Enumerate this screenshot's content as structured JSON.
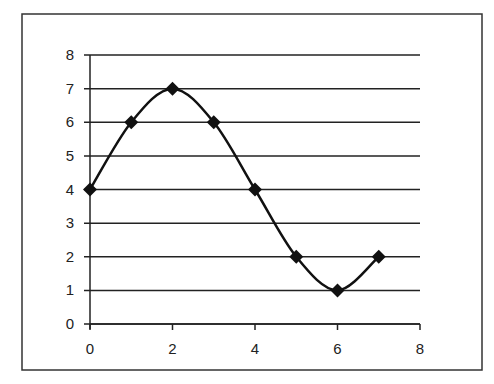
{
  "chart_data": {
    "type": "line",
    "title": "",
    "xlabel": "",
    "ylabel": "",
    "x": [
      0,
      1,
      2,
      3,
      4,
      5,
      6,
      7
    ],
    "series": [
      {
        "name": "Series 1",
        "values": [
          4,
          6,
          7,
          6,
          4,
          2,
          1,
          2
        ],
        "marker": "diamond",
        "smooth": true,
        "color": "#111111"
      }
    ],
    "xlim": [
      0,
      8
    ],
    "ylim": [
      0,
      8
    ],
    "x_ticks": [
      "0",
      "2",
      "4",
      "6",
      "8"
    ],
    "y_ticks": [
      "0",
      "1",
      "2",
      "3",
      "4",
      "5",
      "6",
      "7",
      "8"
    ],
    "grid": {
      "horizontal": true,
      "vertical": false
    },
    "legend": null
  }
}
